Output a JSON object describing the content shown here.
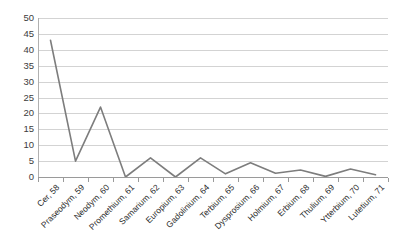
{
  "chart_data": {
    "type": "line",
    "title": "",
    "subtitle": "",
    "xlabel": "",
    "ylabel": "",
    "ylim": [
      0,
      50
    ],
    "ytick_step": 5,
    "yticks": [
      "50",
      "45",
      "40",
      "35",
      "30",
      "25",
      "20",
      "15",
      "10",
      "5",
      "0"
    ],
    "grid": true,
    "legend": false,
    "legend_position": "none",
    "line_color": "#7d7d7d",
    "gridline_color": "#d3d3d3",
    "categories": [
      "Cer, 58",
      "Praseodym, 59",
      "Neodym, 60",
      "Promethium, 61",
      "Samarium, 62",
      "Europium, 63",
      "Gadolinium, 64",
      "Terbium, 65",
      "Dysprosium, 66",
      "Holmium, 67",
      "Erbium, 68",
      "Thulium, 69",
      "Ytterbium, 70",
      "Lutetium, 71"
    ],
    "values": [
      43,
      5,
      22,
      0,
      6,
      0,
      6,
      1,
      4.5,
      1.2,
      2.2,
      0.2,
      2.5,
      0.7
    ],
    "series": [
      {
        "name": "",
        "values": [
          43,
          5,
          22,
          0,
          6,
          0,
          6,
          1,
          4.5,
          1.2,
          2.2,
          0.2,
          2.5,
          0.7
        ]
      }
    ]
  },
  "caption": {
    "text": ""
  }
}
